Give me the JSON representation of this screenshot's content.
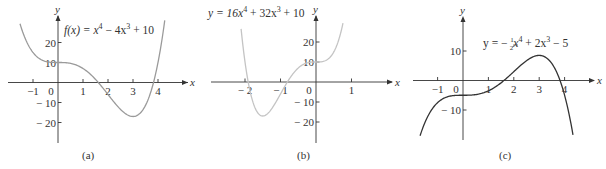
{
  "chart_data": [
    {
      "type": "line",
      "panel": "a",
      "caption": "(a)",
      "title": "f(x) = x^4 - 4x^3 + 10",
      "equation": {
        "lhs": "f(x) = x",
        "p1": "4",
        "mid": " − 4x",
        "p2": "3",
        "rhs": " + 10"
      },
      "xlabel": "x",
      "ylabel": "y",
      "coefficients": [
        1,
        -4,
        0,
        0,
        10
      ],
      "x_domain": [
        -1.52,
        4.27
      ],
      "xlim": [
        -1.8,
        5.3
      ],
      "ylim": [
        -30,
        33
      ],
      "x_ticks": [
        -1,
        0,
        1,
        2,
        3,
        4
      ],
      "x_tick_labels": [
        "−1",
        "0",
        "1",
        "2",
        "3",
        "4"
      ],
      "y_ticks": [
        20,
        10,
        -10,
        -20
      ],
      "y_tick_labels": [
        "20",
        "10",
        "− 10",
        "− 20"
      ],
      "key_points": [
        {
          "x": 0,
          "y": 10
        },
        {
          "x": 3,
          "y": -17
        }
      ],
      "curve_color": "#9a9a9a",
      "grid": false
    },
    {
      "type": "line",
      "panel": "b",
      "caption": "(b)",
      "title": "y = 16x^4 + 32x^3 + 10",
      "equation": {
        "lhs": "y = 16x",
        "p1": "4",
        "mid": " + 32x",
        "p2": "3",
        "rhs": " + 10"
      },
      "xlabel": "x",
      "ylabel": "y",
      "coefficients": [
        16,
        32,
        0,
        0,
        10
      ],
      "x_domain": [
        -2.11,
        0.76
      ],
      "xlim": [
        -2.95,
        2.15
      ],
      "ylim": [
        -30,
        33
      ],
      "x_ticks": [
        -2,
        -1,
        0,
        1
      ],
      "x_tick_labels": [
        "− 2",
        "− 1",
        "0",
        "1"
      ],
      "y_ticks": [
        20,
        10,
        -10,
        -20
      ],
      "y_tick_labels": [
        "20",
        "10",
        "− 10",
        "− 20"
      ],
      "key_points": [
        {
          "x": 0,
          "y": 10
        },
        {
          "x": -1.5,
          "y": -17
        }
      ],
      "curve_color": "#c4c4c4",
      "grid": false
    },
    {
      "type": "line",
      "panel": "c",
      "caption": "(c)",
      "title": "y = -1/2 x^4 + 2x^3 - 5",
      "equation": {
        "lhs": "y = − ",
        "frac_n": "1",
        "frac_d": "2",
        "x1": "x",
        "p1": "4",
        "mid": " + 2x",
        "p2": "3",
        "rhs": " − 5"
      },
      "xlabel": "x",
      "ylabel": "y",
      "coefficients": [
        -0.5,
        2,
        0,
        0,
        -5
      ],
      "x_domain": [
        -1.69,
        4.33
      ],
      "xlim": [
        -2.0,
        5.2
      ],
      "ylim": [
        -22,
        22
      ],
      "x_ticks": [
        -1,
        0,
        1,
        2,
        3,
        4
      ],
      "x_tick_labels": [
        "−1",
        "0",
        "1",
        "2",
        "3",
        "4"
      ],
      "y_ticks": [
        10,
        -10
      ],
      "y_tick_labels": [
        "10",
        "− 10"
      ],
      "key_points": [
        {
          "x": 0,
          "y": -5
        },
        {
          "x": 3,
          "y": 8.5
        }
      ],
      "curve_color": "#333333",
      "grid": false
    }
  ]
}
